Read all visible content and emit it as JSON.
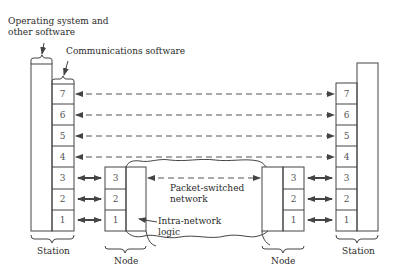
{
  "diagram": {
    "annotations": {
      "os_software": [
        "Operating system and",
        "other software"
      ],
      "comms_software": "Communications software",
      "packet_network": [
        "Packet-switched",
        "network"
      ],
      "intra_network": [
        "Intra-network",
        "logic"
      ]
    },
    "labels": {
      "left_station": "Station",
      "left_node": "Node",
      "right_node": "Node",
      "right_station": "Station"
    },
    "layers": {
      "station_layers": [
        "7",
        "6",
        "5",
        "4",
        "3",
        "2",
        "1"
      ],
      "node_layers": [
        "3",
        "2",
        "1"
      ]
    },
    "connections": {
      "end_to_end_dashed_layers": [
        "7",
        "6",
        "5",
        "4"
      ],
      "node_to_node_dashed_layer": "3",
      "station_node_solid_layers": [
        "3",
        "2",
        "1"
      ]
    },
    "colors": {
      "line": "#333333",
      "text": "#2a2a2a",
      "background": "#ffffff"
    }
  }
}
